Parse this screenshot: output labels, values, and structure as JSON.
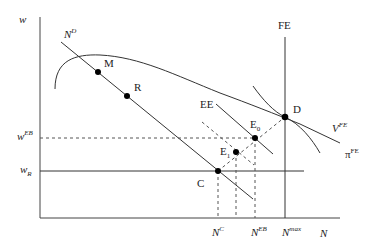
{
  "axes": {
    "y_label": "w",
    "x_label": "N"
  },
  "y_ticks": {
    "w_EB": {
      "base": "w",
      "sup": "EB"
    },
    "w_R": {
      "base": "w",
      "sub": "R"
    }
  },
  "x_ticks": {
    "N_C": {
      "base": "N",
      "sup": "C"
    },
    "N_EB": {
      "base": "N",
      "sup": "EB"
    },
    "N_max": {
      "base": "N",
      "sup": "max"
    }
  },
  "curves": {
    "labor_demand": {
      "base": "N",
      "sup": "D"
    },
    "full_employment": "FE",
    "efficiency": "EE",
    "value_fe": {
      "base": "V",
      "sup": "FE"
    },
    "profit_fe": {
      "base": "π",
      "sup": "FE"
    }
  },
  "points": {
    "M": "M",
    "R": "R",
    "D": "D",
    "E0": {
      "base": "E",
      "sub": "0"
    },
    "E1": {
      "base": "E",
      "sub": "1"
    },
    "C": "C"
  }
}
